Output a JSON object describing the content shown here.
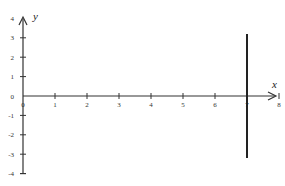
{
  "chart_data": {
    "type": "line",
    "title": "",
    "xlabel": "x",
    "ylabel": "y",
    "xlim": [
      0,
      8
    ],
    "ylim": [
      -4,
      4
    ],
    "x_ticks": [
      "0",
      "1",
      "2",
      "3",
      "4",
      "5",
      "6",
      "7",
      "8"
    ],
    "y_ticks": [
      "4",
      "3",
      "2",
      "1",
      "0",
      "-1",
      "-2",
      "-3",
      "-4"
    ],
    "grid": false,
    "legend": null,
    "series": [
      {
        "name": "x = 7",
        "x": [
          7,
          7
        ],
        "y": [
          3.2,
          -3.2
        ]
      }
    ]
  },
  "labels": {
    "x_axis": "x",
    "y_axis": "y"
  }
}
